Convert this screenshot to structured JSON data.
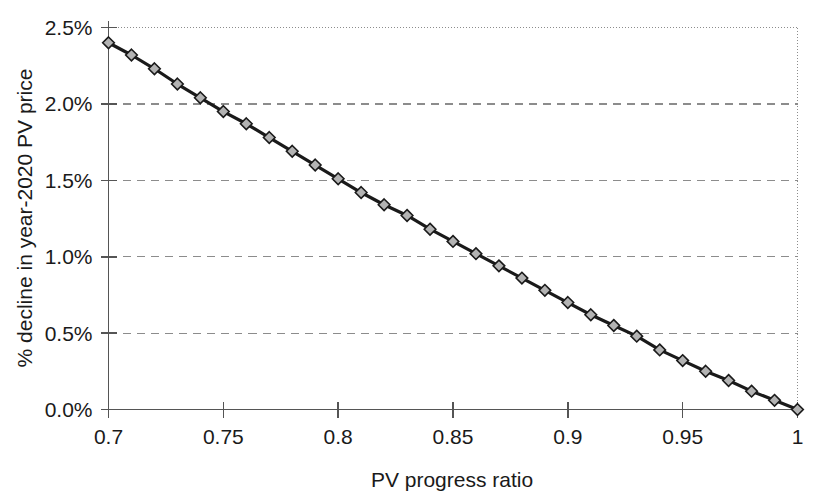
{
  "chart_data": {
    "type": "line",
    "title": "",
    "xlabel": "PV progress ratio",
    "ylabel": "% decline in year-2020 PV price",
    "xlim": [
      0.7,
      1.0
    ],
    "ylim": [
      0.0,
      2.5
    ],
    "xtick_labels": [
      "0.7",
      "0.75",
      "0.8",
      "0.85",
      "0.9",
      "0.95",
      "1"
    ],
    "xticks": [
      0.7,
      0.75,
      0.8,
      0.85,
      0.9,
      0.95,
      1.0
    ],
    "ytick_labels": [
      "0.0%",
      "0.5%",
      "1.0%",
      "1.5%",
      "2.0%",
      "2.5%"
    ],
    "yticks": [
      0.0,
      0.5,
      1.0,
      1.5,
      2.0,
      2.5
    ],
    "grid": "horizontal-dashed",
    "legend": "none",
    "marker": "diamond",
    "marker_fill": "#b3b3b3",
    "marker_stroke": "#1a1a1a",
    "line_color": "#1a1a1a",
    "x": [
      0.7,
      0.71,
      0.72,
      0.73,
      0.74,
      0.75,
      0.76,
      0.77,
      0.78,
      0.79,
      0.8,
      0.81,
      0.82,
      0.83,
      0.84,
      0.85,
      0.86,
      0.87,
      0.88,
      0.89,
      0.9,
      0.91,
      0.92,
      0.93,
      0.94,
      0.95,
      0.96,
      0.97,
      0.98,
      0.99,
      1.0
    ],
    "values": [
      2.4,
      2.32,
      2.23,
      2.13,
      2.04,
      1.95,
      1.87,
      1.78,
      1.69,
      1.6,
      1.51,
      1.42,
      1.34,
      1.27,
      1.18,
      1.1,
      1.02,
      0.94,
      0.86,
      0.78,
      0.7,
      0.62,
      0.55,
      0.48,
      0.39,
      0.32,
      0.25,
      0.19,
      0.12,
      0.06,
      0.0
    ],
    "units": "percent"
  },
  "colors": {
    "axis": "#555555",
    "grid": "#8c8c8c",
    "series": "#1a1a1a",
    "marker_fill": "#b3b3b3",
    "background": "#ffffff"
  }
}
